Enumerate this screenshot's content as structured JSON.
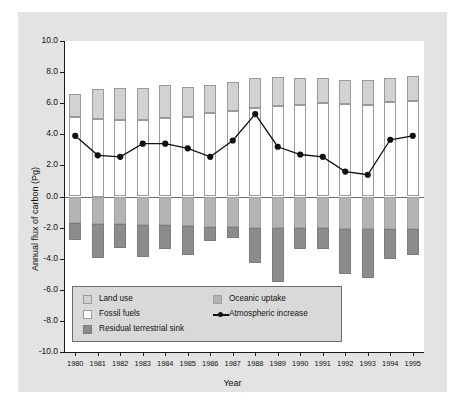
{
  "chart_data": {
    "type": "bar",
    "title": "",
    "xlabel": "Year",
    "ylabel": "Annual flux of carbon (Pg)",
    "ylim": [
      -10.0,
      10.0
    ],
    "ytick_labels": [
      "10.0",
      "8.0",
      "6.0",
      "4.0",
      "2.0",
      "0.0",
      "-2.0",
      "-4.0",
      "-6.0",
      "-8.0",
      "-10.0"
    ],
    "ytick_values": [
      10.0,
      8.0,
      6.0,
      4.0,
      2.0,
      0.0,
      -2.0,
      -4.0,
      -6.0,
      -8.0,
      -10.0
    ],
    "grid": false,
    "legend_position": "lower-left-inside",
    "categories": [
      "1980",
      "1981",
      "1982",
      "1983",
      "1984",
      "1985",
      "1986",
      "1987",
      "1988",
      "1989",
      "1990",
      "1991",
      "1992",
      "1993",
      "1994",
      "1995"
    ],
    "series": [
      {
        "name": "Fossil fuels",
        "type": "bar-stacked-positive",
        "color": "#ffffff",
        "values": [
          5.1,
          5.0,
          4.95,
          4.95,
          5.05,
          5.1,
          5.35,
          5.5,
          5.7,
          5.8,
          5.9,
          6.0,
          5.95,
          5.9,
          6.05,
          6.15
        ]
      },
      {
        "name": "Land use",
        "type": "bar-stacked-positive",
        "color": "#d2d2d2",
        "values": [
          1.5,
          1.9,
          2.0,
          2.05,
          2.1,
          1.95,
          1.85,
          1.85,
          1.9,
          1.9,
          1.75,
          1.6,
          1.55,
          1.6,
          1.6,
          1.6
        ]
      },
      {
        "name": "Oceanic uptake",
        "type": "bar-stacked-negative",
        "color": "#b4b4b4",
        "values": [
          -1.7,
          -1.8,
          -1.8,
          -1.85,
          -1.85,
          -1.9,
          -1.95,
          -1.95,
          -2.0,
          -2.0,
          -2.0,
          -2.05,
          -2.1,
          -2.1,
          -2.1,
          -2.1
        ]
      },
      {
        "name": "Residual terrestrial sink",
        "type": "bar-stacked-negative",
        "color": "#8c8c8c",
        "values": [
          -1.1,
          -2.15,
          -1.5,
          -2.05,
          -1.5,
          -1.85,
          -0.9,
          -0.75,
          -2.25,
          -3.5,
          -1.4,
          -1.3,
          -2.9,
          -3.15,
          -1.9,
          -1.65
        ]
      },
      {
        "name": "Atmospheric increase",
        "type": "line",
        "color": "#111111",
        "marker": "filled-circle",
        "values": [
          3.9,
          2.65,
          2.55,
          3.4,
          3.4,
          3.1,
          2.55,
          3.6,
          5.3,
          3.2,
          2.7,
          2.55,
          1.6,
          1.4,
          3.65,
          3.9
        ]
      }
    ]
  },
  "legend": {
    "entries": [
      {
        "label": "Land use",
        "swatch": "light-grey-square"
      },
      {
        "label": "Fossil fuels",
        "swatch": "white-square"
      },
      {
        "label": "Residual terrestrial sink",
        "swatch": "dark-grey-square"
      },
      {
        "label": "Oceanic uptake",
        "swatch": "mid-grey-square"
      },
      {
        "label": "Atmospheric increase",
        "swatch": "line-with-marker"
      }
    ]
  },
  "colors": {
    "fossil_fuels": "#ffffff",
    "land_use": "#d2d2d2",
    "oceanic_uptake": "#b4b4b4",
    "residual_terrestrial_sink": "#8c8c8c",
    "line": "#111111",
    "figure_background": "#e3e3e3",
    "plot_background": "#ffffff"
  }
}
